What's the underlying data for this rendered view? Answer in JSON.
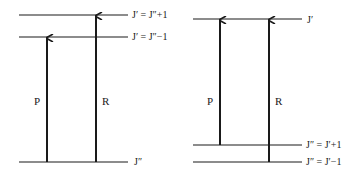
{
  "diagrams": [
    {
      "name": "left",
      "levels": [
        {
          "label": "J′ = J″+1",
          "y": 15
        },
        {
          "label": "J′ = J″−1",
          "y": 37
        },
        {
          "label": "J″",
          "y": 162
        }
      ],
      "arrows": [
        {
          "label": "P",
          "x": 47,
          "from_y": 162,
          "to_y": 37
        },
        {
          "label": "R",
          "x": 96,
          "from_y": 162,
          "to_y": 15
        }
      ]
    },
    {
      "name": "right",
      "levels": [
        {
          "label": "J′",
          "y": 19
        },
        {
          "label": "J″ = J′+1",
          "y": 145
        },
        {
          "label": "J″ = J′−1",
          "y": 162
        }
      ],
      "arrows": [
        {
          "label": "P",
          "x": 220,
          "from_y": 145,
          "to_y": 19
        },
        {
          "label": "R",
          "x": 269,
          "from_y": 162,
          "to_y": 19
        }
      ]
    }
  ]
}
